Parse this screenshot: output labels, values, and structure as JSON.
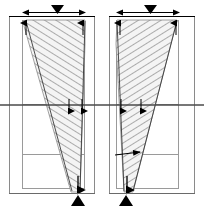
{
  "figure": {
    "type": "engineering-diagram",
    "background_color": "#ffffff",
    "line_color": "#000000",
    "frame_color": "#8a8a8a",
    "hatch_color": "#7d7d7d",
    "fill_color": "#f2f2f2",
    "midline_color": "#555555"
  },
  "panels": [
    {
      "id": "panel-left",
      "name": "left-panel",
      "outer_frame": {
        "x": 9,
        "y": 16,
        "width": 86,
        "height": 178
      },
      "upper_block": {
        "x": 22,
        "y": 20,
        "width": 63,
        "height": 85
      },
      "lower_block": {
        "x": 22,
        "y": 105,
        "width": 63,
        "height": 50
      },
      "bottom_block": {
        "x": 22,
        "y": 155,
        "width": 63,
        "height": 34
      },
      "strut": {
        "name": "diagonal-strut-zone",
        "points": "26,20 85,20 85,40 78,192 70,192",
        "direction": "converging-downward-right"
      },
      "top_dimension": {
        "y": 12,
        "x1": 22,
        "x2": 85,
        "arrow_left": true,
        "arrow_right": true
      },
      "load_triangle": {
        "cx": 57,
        "cy": 9,
        "direction": "down"
      },
      "support_triangle": {
        "cx": 78,
        "cy": 202,
        "direction": "up"
      },
      "midline": {
        "y": 105,
        "x1": 0,
        "x2": 102
      },
      "internal_arrows": [
        {
          "x": 26,
          "y1": 34,
          "y2": 21,
          "direction": "up"
        },
        {
          "x": 83,
          "y1": 34,
          "y2": 21,
          "direction": "up"
        },
        {
          "x": 70,
          "y1": 100,
          "y2": 114,
          "direction": "down"
        },
        {
          "x": 83,
          "y1": 100,
          "y2": 114,
          "direction": "down"
        },
        {
          "x": 78,
          "y1": 178,
          "y2": 192,
          "direction": "down"
        }
      ]
    },
    {
      "id": "panel-right",
      "name": "right-panel",
      "outer_frame": {
        "x": 109,
        "y": 16,
        "width": 86,
        "height": 178
      },
      "upper_block": {
        "x": 116,
        "y": 20,
        "width": 63,
        "height": 85
      },
      "lower_block": {
        "x": 116,
        "y": 105,
        "width": 63,
        "height": 50
      },
      "bottom_block": {
        "x": 116,
        "y": 155,
        "width": 63,
        "height": 34
      },
      "strut": {
        "name": "diagonal-strut-zone",
        "points": "116,20 176,20 132,192 124,192 116,40",
        "direction": "converging-downward-left"
      },
      "top_dimension": {
        "y": 12,
        "x1": 116,
        "x2": 179,
        "arrow_left": true,
        "arrow_right": true
      },
      "load_triangle": {
        "cx": 150,
        "cy": 9,
        "direction": "down"
      },
      "support_triangle": {
        "cx": 126,
        "cy": 202,
        "direction": "up"
      },
      "midline": {
        "y": 105,
        "x1": 102,
        "x2": 204
      },
      "internal_arrows": [
        {
          "x": 120,
          "y1": 34,
          "y2": 21,
          "direction": "up"
        },
        {
          "x": 176,
          "y1": 34,
          "y2": 21,
          "direction": "up"
        },
        {
          "x": 120,
          "y1": 100,
          "y2": 114,
          "direction": "down"
        },
        {
          "x": 140,
          "y1": 100,
          "y2": 114,
          "direction": "down"
        },
        {
          "x": 127,
          "y1": 178,
          "y2": 192,
          "direction": "down"
        }
      ]
    }
  ],
  "labels": {
    "title": "",
    "caption": "",
    "left_panel_label": "",
    "right_panel_label": ""
  }
}
